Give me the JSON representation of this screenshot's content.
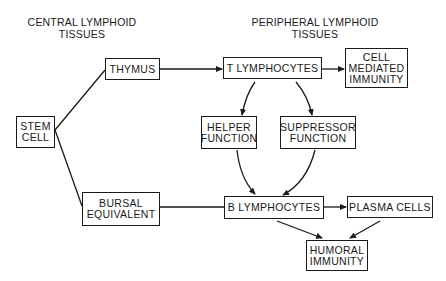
{
  "headings": {
    "central": [
      "CENTRAL LYMPHOID",
      "TISSUES"
    ],
    "peripheral": [
      "PERIPHERAL LYMPHOID",
      "TISSUES"
    ]
  },
  "nodes": {
    "stem_cell": [
      "STEM",
      "CELL"
    ],
    "thymus": [
      "THYMUS"
    ],
    "bursal_equivalent": [
      "BURSAL",
      "EQUIVALENT"
    ],
    "t_lymphocytes": [
      "T LYMPHOCYTES"
    ],
    "cell_mediated_immunity": [
      "CELL",
      "MEDIATED",
      "IMMUNITY"
    ],
    "helper_function": [
      "HELPER",
      "FUNCTION"
    ],
    "suppressor_function": [
      "SUPPRESSOR",
      "FUNCTION"
    ],
    "b_lymphocytes": [
      "B LYMPHOCYTES"
    ],
    "plasma_cells": [
      "PLASMA CELLS"
    ],
    "humoral_immunity": [
      "HUMORAL",
      "IMMUNITY"
    ]
  },
  "edges": [
    {
      "from": "STEM CELL",
      "to": "THYMUS",
      "arrow": false
    },
    {
      "from": "STEM CELL",
      "to": "BURSAL EQUIVALENT",
      "arrow": false
    },
    {
      "from": "THYMUS",
      "to": "T LYMPHOCYTES",
      "arrow": true
    },
    {
      "from": "T LYMPHOCYTES",
      "to": "CELL MEDIATED IMMUNITY",
      "arrow": true
    },
    {
      "from": "T LYMPHOCYTES",
      "to": "HELPER FUNCTION",
      "arrow": true
    },
    {
      "from": "T LYMPHOCYTES",
      "to": "SUPPRESSOR FUNCTION",
      "arrow": true
    },
    {
      "from": "HELPER FUNCTION",
      "to": "B LYMPHOCYTES",
      "arrow": true
    },
    {
      "from": "SUPPRESSOR FUNCTION",
      "to": "B LYMPHOCYTES",
      "arrow": true
    },
    {
      "from": "BURSAL EQUIVALENT",
      "to": "B LYMPHOCYTES",
      "arrow": false
    },
    {
      "from": "B LYMPHOCYTES",
      "to": "PLASMA CELLS",
      "arrow": true
    },
    {
      "from": "B LYMPHOCYTES",
      "to": "HUMORAL IMMUNITY",
      "arrow": true
    },
    {
      "from": "PLASMA CELLS",
      "to": "HUMORAL IMMUNITY",
      "arrow": true
    }
  ]
}
